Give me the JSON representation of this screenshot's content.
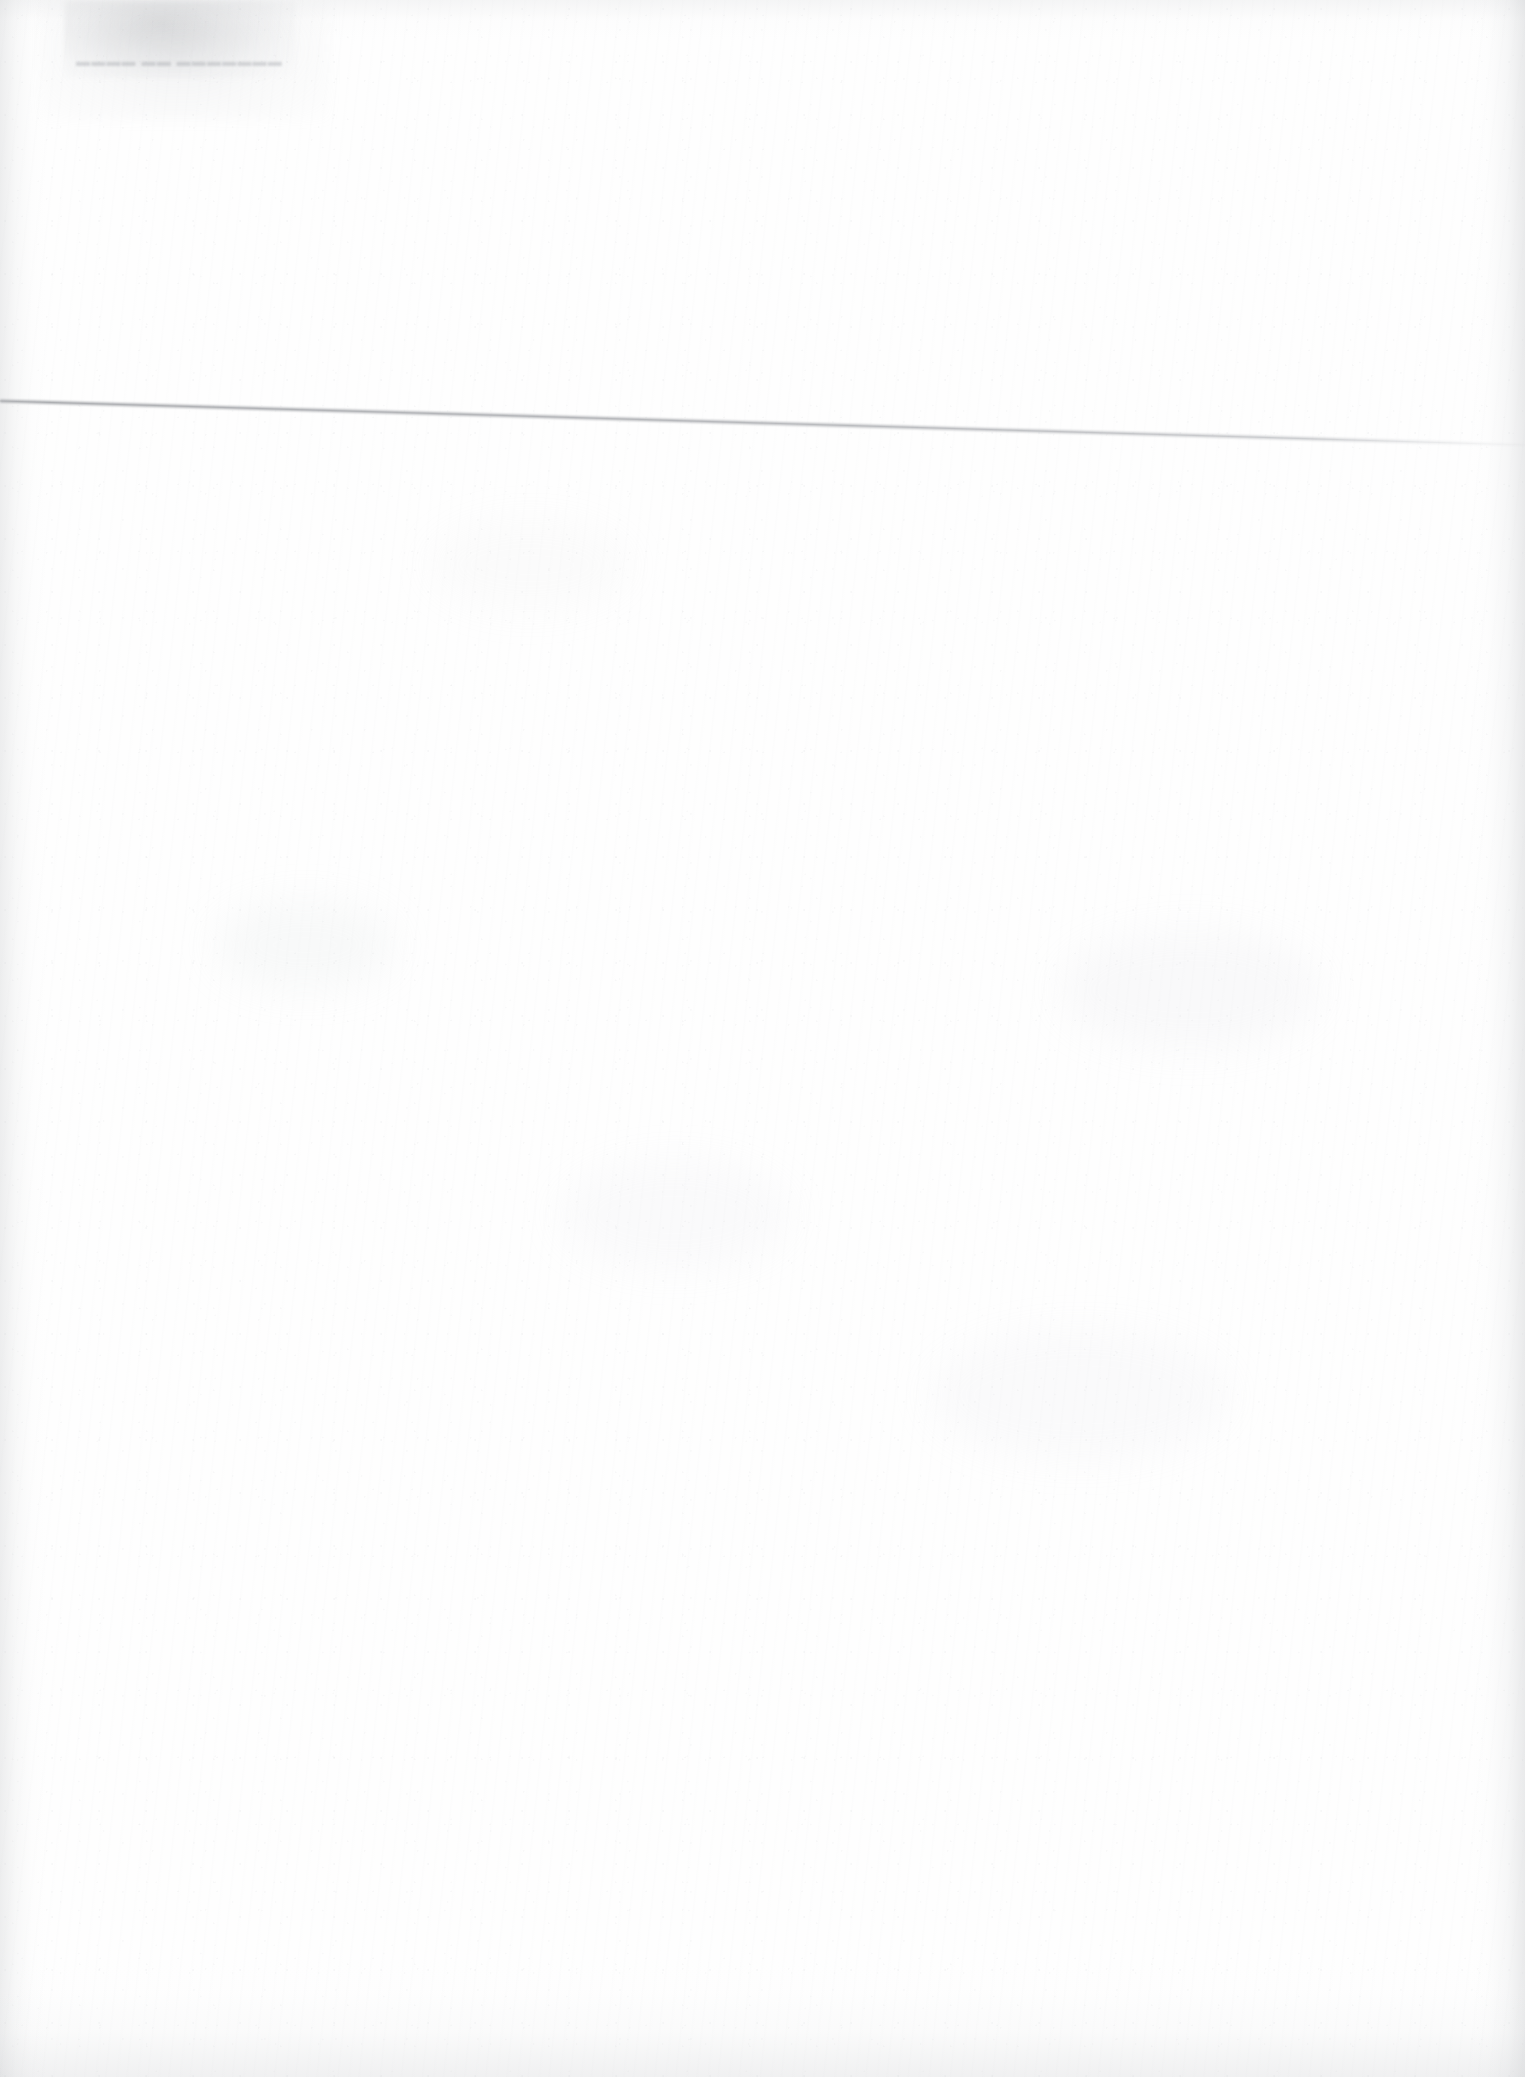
{
  "document": {
    "kind": "scanned-page",
    "title": "Scanned blank page",
    "page_width": 1525,
    "page_height": 2077,
    "background_color": "#fefefe",
    "content_summary": "Blank scanned sheet with no legible typeset text; carries a gray smudge band at the top-left, one faint illegible ghost/offset text line, and a single thin ruled scan line crossing the page on a slight downward slant.",
    "legible_text": "",
    "has_legible_text": false
  },
  "artifacts": {
    "smudge": {
      "name": "top-left-smudge",
      "description": "Gray toner smudge / bleed-through band at the top-left corner",
      "x": 64,
      "y": 0,
      "width": 232,
      "height": 78,
      "color": "#96989c",
      "opacity": 0.3
    },
    "smudge_halo": {
      "name": "top-left-smudge-halo",
      "description": "Soft diffuse halo surrounding the top-left smudge",
      "x": 40,
      "y": 0,
      "width": 290,
      "height": 120,
      "color": "#b6b8bc",
      "opacity": 0.18
    },
    "ghost_text": {
      "name": "ghost-offset-text-line",
      "description": "Faint illegible offset/show-through text line beneath the smudge",
      "x": 76,
      "y": 54,
      "width": 205,
      "height": 18,
      "font_size_px": 14,
      "color": "#a8aaae",
      "opacity": 0.42,
      "placeholder_glyphs": "▬▬▬▬ ▬▬ ▬▬▬▬▬▬▬"
    },
    "rule_line": {
      "name": "horizontal-scan-rule-line",
      "description": "Single thin gray ruled line crossing the full page width on a slight downward slant, fading near the right edge",
      "x1": 0,
      "y1": 401,
      "x2": 1525,
      "y2": 445,
      "stroke_color": "#a9abae",
      "stroke_width": 3.0,
      "opacity": 0.8
    },
    "edges": {
      "left_shadow_color": "#bcbec1",
      "right_shadow_color": "#babcbf",
      "top_shadow_color": "#c4c6c9",
      "bottom_shadow_color": "#bec0c3"
    },
    "grain": {
      "name": "paper-grain",
      "description": "Fine speckle noise and vertical paper fibers across the whole sheet",
      "color": "#d0d2d5",
      "opacity": 0.5
    },
    "blotches": [
      {
        "name": "blotch-mid-left",
        "x": 215,
        "y": 900,
        "width": 180,
        "height": 90,
        "color": "#dcdee1",
        "opacity": 0.16
      },
      {
        "name": "blotch-mid-center",
        "x": 560,
        "y": 1160,
        "width": 230,
        "height": 110,
        "color": "#dfe1e4",
        "opacity": 0.13
      },
      {
        "name": "blotch-mid-right",
        "x": 1060,
        "y": 930,
        "width": 260,
        "height": 120,
        "color": "#dddfe2",
        "opacity": 0.15
      },
      {
        "name": "blotch-lower-right",
        "x": 930,
        "y": 1330,
        "width": 300,
        "height": 130,
        "color": "#e0e2e5",
        "opacity": 0.12
      },
      {
        "name": "blotch-upper-mid",
        "x": 430,
        "y": 520,
        "width": 200,
        "height": 90,
        "color": "#e1e3e6",
        "opacity": 0.11
      }
    ]
  }
}
